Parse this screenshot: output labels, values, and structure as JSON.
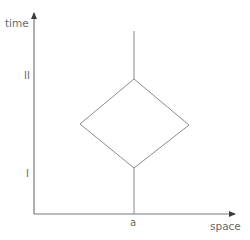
{
  "diagram": {
    "type": "spacetime-diagram",
    "axes": {
      "y_label": "time",
      "x_label": "space",
      "color": "#7a7a7a"
    },
    "ticks": {
      "time_upper": "II",
      "time_lower": "I",
      "space_position": "a"
    },
    "colors": {
      "line": "#8c8c8c",
      "text": "#6a6a6a",
      "background": "#ffffff"
    },
    "worldline": {
      "x": 134,
      "top_segment": [
        31,
        79
      ],
      "bottom_segment": [
        168,
        214
      ]
    },
    "diamond": {
      "top": [
        134,
        79
      ],
      "left": [
        80,
        124
      ],
      "right": [
        189,
        125
      ],
      "bottom": [
        134,
        168
      ]
    }
  }
}
